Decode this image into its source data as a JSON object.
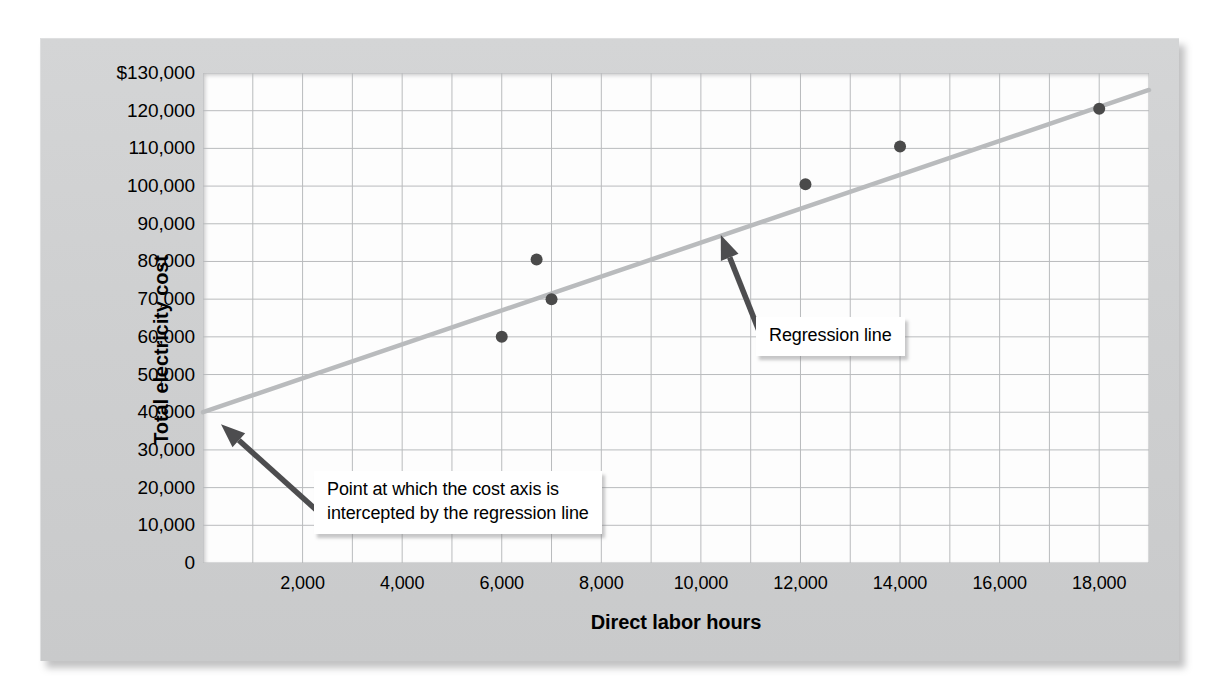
{
  "chart_data": {
    "type": "scatter",
    "title": "",
    "xlabel": "Direct labor hours",
    "ylabel": "Total electricity cost",
    "xlim": [
      0,
      19000
    ],
    "ylim": [
      0,
      130000
    ],
    "grid": true,
    "legend_position": "none",
    "x_ticks": [
      "2,000",
      "4,000",
      "6,000",
      "8,000",
      "10,000",
      "12,000",
      "14,000",
      "16,000",
      "18,000"
    ],
    "x_tick_values": [
      2000,
      4000,
      6000,
      8000,
      10000,
      12000,
      14000,
      16000,
      18000
    ],
    "y_ticks": [
      "$130,000",
      "120,000",
      "110,000",
      "100,000",
      "90,000",
      "80,000",
      "70,000",
      "60,000",
      "50,000",
      "40,000",
      "30,000",
      "20,000",
      "10,000",
      "0"
    ],
    "y_tick_values": [
      130000,
      120000,
      110000,
      100000,
      90000,
      80000,
      70000,
      60000,
      50000,
      40000,
      30000,
      20000,
      10000,
      0
    ],
    "gridline_step_x": 1000,
    "gridline_step_y": 10000,
    "points": [
      {
        "x": 6000,
        "y": 60000
      },
      {
        "x": 6700,
        "y": 80500
      },
      {
        "x": 7000,
        "y": 70000
      },
      {
        "x": 12100,
        "y": 100500
      },
      {
        "x": 14000,
        "y": 110500
      },
      {
        "x": 18000,
        "y": 120500
      }
    ],
    "series": [
      {
        "name": "Regression line",
        "type": "line",
        "intercept": 40000,
        "slope": 4.5,
        "x_start": 0,
        "y_start": 40000,
        "x_end": 19000,
        "y_end": 125500
      }
    ],
    "annotations": [
      {
        "id": "intercept",
        "text": "Point at which the cost axis is\nintercepted by the regression line",
        "points_to_x": 0,
        "points_to_y": 40000
      },
      {
        "id": "regression",
        "text": "Regression line",
        "points_to_x": 10400,
        "points_to_y": 87000
      }
    ],
    "colors": {
      "point": "#4a4a4a",
      "regression_line": "#b9bbbd",
      "gridline": "#b9bbbd",
      "arrow": "#4d4d4f",
      "plot_background": "#fdfdfd",
      "panel_background": "#cfd0d1",
      "text": "#000000"
    }
  }
}
